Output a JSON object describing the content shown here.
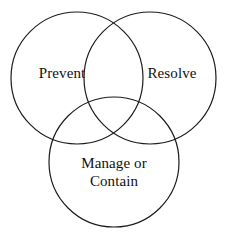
{
  "diagram": {
    "type": "venn-3-circle",
    "title": "",
    "background_color": "#ffffff",
    "stroke_color": "#1c1c1c",
    "text_color": "#111111",
    "circles": [
      {
        "id": "prevent",
        "label": "Prevent",
        "cx": 77,
        "cy": 78,
        "r": 66
      },
      {
        "id": "resolve",
        "label": "Resolve",
        "cx": 150,
        "cy": 78,
        "r": 66
      },
      {
        "id": "manage-or-contain",
        "label": "Manage or\nContain",
        "cx": 114,
        "cy": 162,
        "r": 65
      }
    ]
  }
}
